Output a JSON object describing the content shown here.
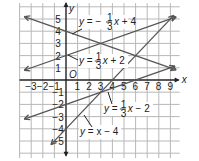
{
  "chart_data": {
    "type": "line",
    "title": "",
    "xlabel": "x",
    "ylabel": "y",
    "origin_label": "O",
    "xlim": [
      -3.5,
      9.5
    ],
    "ylim": [
      -6,
      6
    ],
    "grid": true,
    "x_ticks": [
      -3,
      -2,
      -1,
      1,
      2,
      3,
      4,
      5,
      6,
      7,
      8,
      9
    ],
    "y_ticks": [
      -5,
      -4,
      -3,
      -2,
      -1,
      1,
      2,
      3,
      4,
      5
    ],
    "series": [
      {
        "name": "y = -1/3 x + 4",
        "slope": -0.3333,
        "intercept": 4,
        "label": "y = −",
        "frac": "1/3",
        "rest": "x + 4"
      },
      {
        "name": "y = 1/3 x + 2",
        "slope": 0.3333,
        "intercept": 2,
        "label": "y =",
        "frac": "1/3",
        "rest": "x + 2"
      },
      {
        "name": "y = 1/3 x - 2",
        "slope": 0.3333,
        "intercept": -2,
        "label": "y =",
        "frac": "1/3",
        "rest": "x − 2"
      },
      {
        "name": "y = x - 4",
        "slope": 1,
        "intercept": -4,
        "label": "y = x − 4"
      }
    ],
    "colors": {
      "grid": "#b8b8b8",
      "axis": "#222222",
      "line": "#555555",
      "background": "#ffffff"
    }
  }
}
